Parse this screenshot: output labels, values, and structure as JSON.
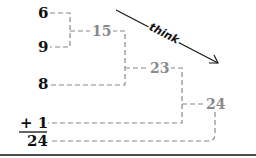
{
  "diagram": {
    "addends": [
      {
        "label": "6"
      },
      {
        "label": "9"
      },
      {
        "label": "8"
      },
      {
        "label": "+ 1"
      }
    ],
    "result": "24",
    "partial_sums": [
      {
        "label": "15"
      },
      {
        "label": "23"
      },
      {
        "label": "24"
      }
    ],
    "arrow_label": "think",
    "colors": {
      "addend_text": "#111111",
      "partial_sum_text": "#8a8a8a",
      "dashed_line": "#8a8a8a"
    }
  }
}
